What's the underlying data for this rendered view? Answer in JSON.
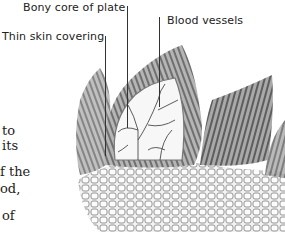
{
  "labels": {
    "bony_core": "Bony core of plate",
    "blood_vessels": "Blood vessels",
    "thin_skin": "Thin skin covering"
  },
  "body_text_fragments": [
    "to",
    "its",
    "",
    "f the",
    "od,",
    "",
    "of"
  ]
}
